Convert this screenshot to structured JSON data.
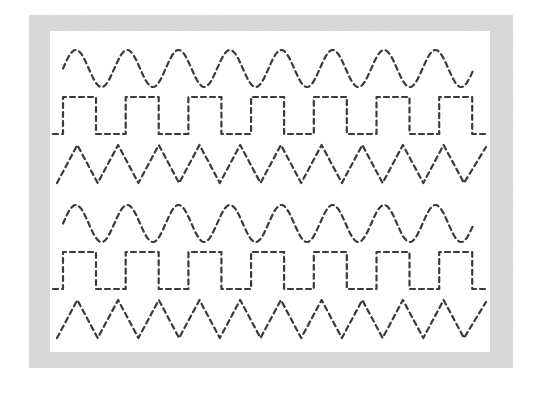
{
  "worksheet": {
    "title": "",
    "frame_color": "#dcdcdc",
    "stroke_color": "#3a3a3a",
    "groups": [
      {
        "rows": [
          {
            "pattern": "sine-wave",
            "cycles": 8
          },
          {
            "pattern": "square-wave",
            "cycles": 7
          },
          {
            "pattern": "triangle-wave",
            "cycles": 10
          }
        ]
      },
      {
        "rows": [
          {
            "pattern": "sine-wave",
            "cycles": 8
          },
          {
            "pattern": "square-wave",
            "cycles": 7
          },
          {
            "pattern": "triangle-wave",
            "cycles": 10
          }
        ]
      }
    ]
  }
}
